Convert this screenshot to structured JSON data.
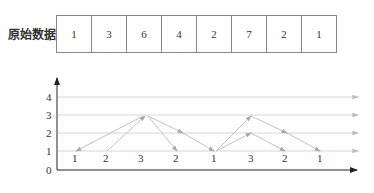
{
  "table": {
    "label": "原始数据",
    "values": [
      "1",
      "3",
      "6",
      "4",
      "2",
      "7",
      "2",
      "1"
    ]
  },
  "chart": {
    "y_ticks": [
      "0",
      "1",
      "2",
      "3",
      "4"
    ],
    "x_labels": [
      "1",
      "2",
      "3",
      "2",
      "1",
      "3",
      "2",
      "1"
    ],
    "colors": {
      "grid": "#cccccc",
      "arrow": "#aaaaaa",
      "axis": "#222222",
      "edge": "#bbbbbb"
    }
  }
}
